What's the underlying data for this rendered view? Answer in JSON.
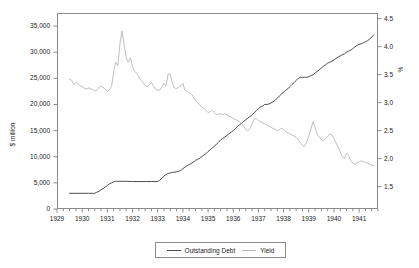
{
  "chart_data": {
    "type": "line",
    "title": "",
    "xlabel": "",
    "ylabel": "$ million",
    "ylabel_right": "%",
    "xlim": [
      1929.0,
      1941.75
    ],
    "ylim": [
      0,
      37500
    ],
    "ylim_right": [
      1.1,
      4.6
    ],
    "grid": false,
    "legend_position": "bottom-center",
    "x_tick_labels": [
      "1929",
      "1930",
      "1931",
      "1932",
      "1933",
      "1934",
      "1935",
      "1936",
      "1937",
      "1938",
      "1939",
      "1940",
      "1941"
    ],
    "x_tick_values": [
      1929,
      1930,
      1931,
      1932,
      1933,
      1934,
      1935,
      1936,
      1937,
      1938,
      1939,
      1940,
      1941
    ],
    "x_minor_tick_interval": 0.25,
    "y_tick_labels_left": [
      "35,000",
      "30,000",
      "25,000",
      "20,000",
      "15,000",
      "10,000",
      "5,000",
      "0"
    ],
    "y_tick_values_left": [
      35000,
      30000,
      25000,
      20000,
      15000,
      10000,
      5000,
      0
    ],
    "y_tick_labels_right": [
      "4.5",
      "4.0",
      "3.5",
      "3.0",
      "2.5",
      "2.0",
      "1.5"
    ],
    "y_tick_values_right": [
      4.5,
      4.0,
      3.5,
      3.0,
      2.5,
      2.0,
      1.5
    ],
    "series": [
      {
        "name": "Outstanding Debt",
        "axis": "left",
        "color": "#4d4d4d",
        "unit": "$ million",
        "x": [
          1929.5,
          1929.75,
          1930.0,
          1930.25,
          1930.5,
          1930.58,
          1930.67,
          1930.75,
          1930.83,
          1930.92,
          1931.0,
          1931.08,
          1931.17,
          1931.25,
          1931.33,
          1931.42,
          1931.5,
          1931.75,
          1932.0,
          1932.25,
          1932.5,
          1932.75,
          1933.0,
          1933.08,
          1933.17,
          1933.25,
          1933.33,
          1933.42,
          1933.5,
          1933.58,
          1933.67,
          1933.75,
          1933.83,
          1933.92,
          1934.0,
          1934.08,
          1934.17,
          1934.25,
          1934.33,
          1934.42,
          1934.5,
          1934.58,
          1934.67,
          1934.75,
          1934.83,
          1934.92,
          1935.0,
          1935.08,
          1935.17,
          1935.25,
          1935.33,
          1935.42,
          1935.5,
          1935.58,
          1935.67,
          1935.75,
          1935.83,
          1935.92,
          1936.0,
          1936.08,
          1936.17,
          1936.25,
          1936.33,
          1936.42,
          1936.5,
          1936.58,
          1936.67,
          1936.75,
          1936.83,
          1936.92,
          1937.0,
          1937.08,
          1937.17,
          1937.25,
          1937.33,
          1937.42,
          1937.5,
          1937.58,
          1937.67,
          1937.75,
          1937.83,
          1937.92,
          1938.0,
          1938.08,
          1938.17,
          1938.25,
          1938.33,
          1938.42,
          1938.5,
          1938.58,
          1938.67,
          1938.75,
          1938.83,
          1938.92,
          1939.0,
          1939.08,
          1939.17,
          1939.25,
          1939.33,
          1939.42,
          1939.5,
          1939.58,
          1939.67,
          1939.75,
          1939.83,
          1939.92,
          1940.0,
          1940.08,
          1940.17,
          1940.25,
          1940.33,
          1940.42,
          1940.5,
          1940.58,
          1940.67,
          1940.75,
          1940.83,
          1940.92,
          1941.0,
          1941.08,
          1941.17,
          1941.25,
          1941.33,
          1941.42,
          1941.5,
          1941.58
        ],
        "y": [
          3000,
          3000,
          3000,
          3000,
          3000,
          3200,
          3400,
          3700,
          3900,
          4200,
          4500,
          4800,
          5000,
          5200,
          5300,
          5300,
          5300,
          5300,
          5250,
          5250,
          5250,
          5250,
          5250,
          5500,
          5900,
          6300,
          6600,
          6800,
          6900,
          7000,
          7050,
          7100,
          7200,
          7400,
          7700,
          8000,
          8300,
          8500,
          8700,
          9000,
          9300,
          9500,
          9700,
          10000,
          10300,
          10600,
          11000,
          11300,
          11700,
          12000,
          12400,
          12800,
          13200,
          13500,
          13800,
          14100,
          14400,
          14700,
          15000,
          15400,
          15800,
          16100,
          16400,
          16800,
          17100,
          17400,
          17700,
          18000,
          18400,
          18800,
          19200,
          19500,
          19700,
          20000,
          20000,
          20100,
          20300,
          20500,
          20800,
          21200,
          21600,
          22000,
          22400,
          22700,
          23000,
          23400,
          23800,
          24200,
          24600,
          25000,
          25200,
          25200,
          25200,
          25200,
          25300,
          25500,
          25700,
          26000,
          26300,
          26600,
          27000,
          27300,
          27600,
          27900,
          28100,
          28300,
          28500,
          28800,
          29100,
          29300,
          29500,
          29700,
          30000,
          30200,
          30400,
          30700,
          31000,
          31300,
          31500,
          31600,
          31800,
          32000,
          32200,
          32500,
          32900,
          33300
        ]
      },
      {
        "name": "Yield",
        "axis": "right",
        "color": "#b3b3b3",
        "unit": "%",
        "x": [
          1929.5,
          1929.58,
          1929.67,
          1929.75,
          1929.83,
          1929.92,
          1930.0,
          1930.08,
          1930.17,
          1930.25,
          1930.33,
          1930.42,
          1930.5,
          1930.58,
          1930.67,
          1930.75,
          1930.83,
          1930.92,
          1931.0,
          1931.08,
          1931.17,
          1931.25,
          1931.33,
          1931.42,
          1931.5,
          1931.58,
          1931.67,
          1931.75,
          1931.83,
          1931.92,
          1932.0,
          1932.08,
          1932.17,
          1932.25,
          1932.33,
          1932.42,
          1932.5,
          1932.58,
          1932.67,
          1932.75,
          1932.83,
          1932.92,
          1933.0,
          1933.08,
          1933.17,
          1933.25,
          1933.33,
          1933.42,
          1933.5,
          1933.58,
          1933.67,
          1933.75,
          1933.83,
          1933.92,
          1934.0,
          1934.08,
          1934.17,
          1934.25,
          1934.33,
          1934.42,
          1934.5,
          1934.58,
          1934.67,
          1934.75,
          1934.83,
          1934.92,
          1935.0,
          1935.08,
          1935.17,
          1935.25,
          1935.33,
          1935.42,
          1935.5,
          1935.58,
          1935.67,
          1935.75,
          1935.83,
          1935.92,
          1936.0,
          1936.08,
          1936.17,
          1936.25,
          1936.33,
          1936.42,
          1936.5,
          1936.58,
          1936.67,
          1936.75,
          1936.83,
          1936.92,
          1937.0,
          1937.08,
          1937.17,
          1937.25,
          1937.33,
          1937.42,
          1937.5,
          1937.58,
          1937.67,
          1937.75,
          1937.83,
          1937.92,
          1938.0,
          1938.08,
          1938.17,
          1938.25,
          1938.33,
          1938.42,
          1938.5,
          1938.58,
          1938.67,
          1938.75,
          1938.83,
          1938.92,
          1939.0,
          1939.08,
          1939.17,
          1939.25,
          1939.33,
          1939.42,
          1939.5,
          1939.58,
          1939.67,
          1939.75,
          1939.83,
          1939.92,
          1940.0,
          1940.08,
          1940.17,
          1940.25,
          1940.33,
          1940.42,
          1940.5,
          1940.58,
          1940.67,
          1940.75,
          1940.83,
          1940.92,
          1941.0,
          1941.08,
          1941.17,
          1941.25,
          1941.33,
          1941.42,
          1941.5,
          1941.58
        ],
        "y": [
          3.42,
          3.4,
          3.32,
          3.36,
          3.34,
          3.3,
          3.28,
          3.26,
          3.24,
          3.26,
          3.25,
          3.23,
          3.21,
          3.22,
          3.27,
          3.29,
          3.27,
          3.24,
          3.2,
          3.22,
          3.3,
          3.55,
          3.72,
          3.66,
          4.05,
          4.28,
          4.02,
          3.8,
          3.72,
          3.8,
          3.64,
          3.56,
          3.52,
          3.46,
          3.4,
          3.36,
          3.3,
          3.28,
          3.32,
          3.36,
          3.3,
          3.24,
          3.22,
          3.22,
          3.28,
          3.34,
          3.3,
          3.52,
          3.5,
          3.34,
          3.26,
          3.25,
          3.27,
          3.3,
          3.34,
          3.22,
          3.2,
          3.18,
          3.16,
          3.1,
          3.04,
          3.0,
          2.96,
          2.92,
          2.9,
          2.86,
          2.82,
          2.84,
          2.86,
          2.82,
          2.78,
          2.8,
          2.8,
          2.78,
          2.8,
          2.78,
          2.76,
          2.74,
          2.72,
          2.7,
          2.68,
          2.66,
          2.62,
          2.58,
          2.52,
          2.5,
          2.54,
          2.62,
          2.7,
          2.72,
          2.68,
          2.66,
          2.64,
          2.62,
          2.6,
          2.58,
          2.56,
          2.54,
          2.52,
          2.5,
          2.52,
          2.54,
          2.52,
          2.48,
          2.46,
          2.44,
          2.42,
          2.4,
          2.38,
          2.34,
          2.28,
          2.24,
          2.22,
          2.3,
          2.4,
          2.52,
          2.66,
          2.56,
          2.44,
          2.38,
          2.34,
          2.32,
          2.36,
          2.4,
          2.44,
          2.42,
          2.36,
          2.28,
          2.2,
          2.12,
          2.04,
          2.0,
          2.1,
          2.06,
          1.96,
          1.92,
          1.9,
          1.92,
          1.94,
          1.96,
          1.95,
          1.93,
          1.92,
          1.9,
          1.88,
          1.88
        ]
      }
    ]
  },
  "legend": {
    "entries": [
      {
        "label": "Outstanding Debt",
        "color": "#4d4d4d"
      },
      {
        "label": "Yield",
        "color": "#b3b3b3"
      }
    ]
  },
  "axes": {
    "left_title": "$ million",
    "right_title": "%"
  }
}
